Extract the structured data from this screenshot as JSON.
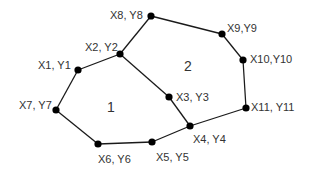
{
  "diagram": {
    "type": "polygon-graph",
    "nodes": [
      {
        "id": "p1",
        "label": "X1, Y1",
        "x": 78,
        "y": 70,
        "lx": 38,
        "ly": 66
      },
      {
        "id": "p2",
        "label": "X2, Y2",
        "x": 120,
        "y": 54,
        "lx": 85,
        "ly": 48
      },
      {
        "id": "p3",
        "label": "X3, Y3",
        "x": 169,
        "y": 97,
        "lx": 176,
        "ly": 98
      },
      {
        "id": "p4",
        "label": "X4, Y4",
        "x": 190,
        "y": 126,
        "lx": 193,
        "ly": 140
      },
      {
        "id": "p5",
        "label": "X5, Y5",
        "x": 152,
        "y": 142,
        "lx": 156,
        "ly": 158
      },
      {
        "id": "p6",
        "label": "X6, Y6",
        "x": 98,
        "y": 144,
        "lx": 98,
        "ly": 160
      },
      {
        "id": "p7",
        "label": "X7, Y7",
        "x": 56,
        "y": 110,
        "lx": 19,
        "ly": 106
      },
      {
        "id": "p8",
        "label": "X8, Y8",
        "x": 151,
        "y": 16,
        "lx": 110,
        "ly": 16
      },
      {
        "id": "p9",
        "label": "X9,Y9",
        "x": 222,
        "y": 34,
        "lx": 227,
        "ly": 29
      },
      {
        "id": "p10",
        "label": "X10,Y10",
        "x": 243,
        "y": 60,
        "lx": 250,
        "ly": 60
      },
      {
        "id": "p11",
        "label": "X11, Y11",
        "x": 246,
        "y": 108,
        "lx": 251,
        "ly": 108
      }
    ],
    "edges": [
      [
        "p1",
        "p2"
      ],
      [
        "p2",
        "p3"
      ],
      [
        "p3",
        "p4"
      ],
      [
        "p4",
        "p5"
      ],
      [
        "p5",
        "p6"
      ],
      [
        "p6",
        "p7"
      ],
      [
        "p7",
        "p1"
      ],
      [
        "p2",
        "p8"
      ],
      [
        "p8",
        "p9"
      ],
      [
        "p9",
        "p10"
      ],
      [
        "p10",
        "p11"
      ],
      [
        "p11",
        "p4"
      ]
    ],
    "regions": [
      {
        "id": "region-1",
        "label": "1",
        "x": 111,
        "y": 108
      },
      {
        "id": "region-2",
        "label": "2",
        "x": 188,
        "y": 67
      }
    ],
    "colors": {
      "line": "#1a1a1a",
      "node": "#000000",
      "text": "#333333",
      "background": "#ffffff"
    }
  }
}
